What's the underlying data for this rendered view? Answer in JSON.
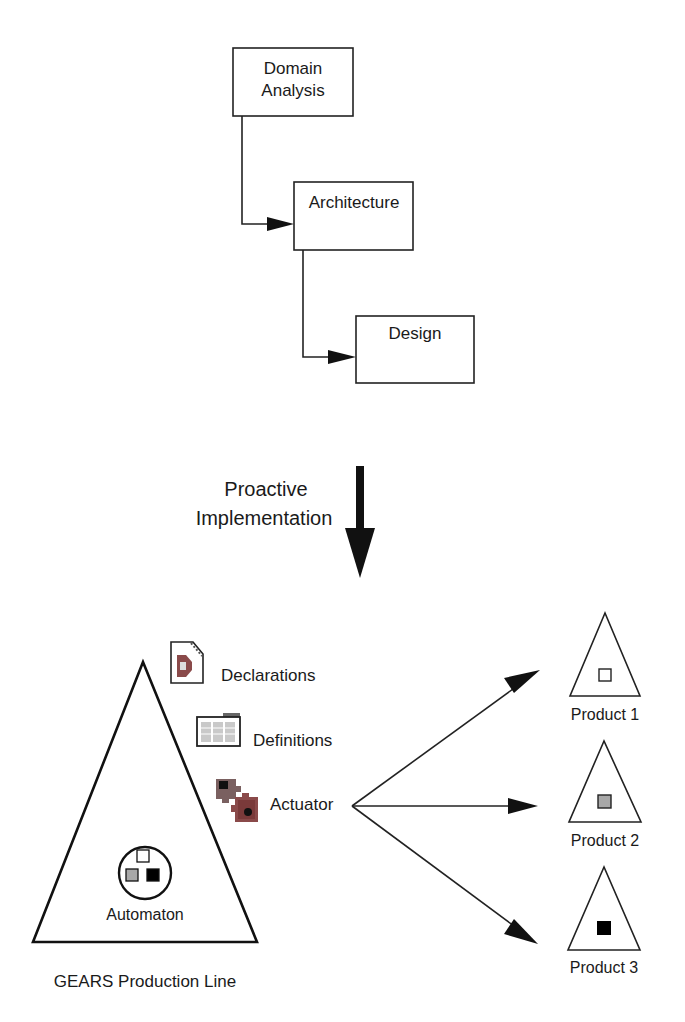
{
  "diagram": {
    "process_boxes": [
      {
        "id": "domain-analysis",
        "lines": [
          "Domain",
          "Analysis"
        ]
      },
      {
        "id": "architecture",
        "lines": [
          "Architecture"
        ]
      },
      {
        "id": "design",
        "lines": [
          "Design"
        ]
      }
    ],
    "transition": {
      "lines": [
        "Proactive",
        "Implementation"
      ]
    },
    "production_line": {
      "label": "GEARS Production Line",
      "automaton_label": "Automaton",
      "artifacts": [
        {
          "icon": "declarations-document-icon",
          "label": "Declarations"
        },
        {
          "icon": "definitions-folder-icon",
          "label": "Definitions"
        },
        {
          "icon": "actuator-puzzle-icon",
          "label": "Actuator"
        }
      ]
    },
    "products": [
      {
        "label": "Product 1",
        "marker": "white-square",
        "fill": "#ffffff"
      },
      {
        "label": "Product 2",
        "marker": "gray-square",
        "fill": "#a8a8a8"
      },
      {
        "label": "Product 3",
        "marker": "black-square",
        "fill": "#000000"
      }
    ],
    "colors": {
      "line": "#222222",
      "gray": "#a8a8a8",
      "icon_red": "#8a4a4a",
      "icon_gray": "#b8b8b8"
    }
  }
}
